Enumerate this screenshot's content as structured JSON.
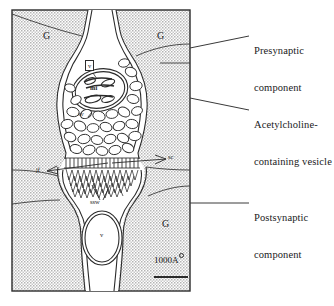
{
  "figure": {
    "frame": {
      "x": 12,
      "y": 10,
      "width": 178,
      "height": 281
    },
    "background_fill": "#d9d9d9",
    "line_color": "#1a1a1a"
  },
  "callouts": [
    {
      "id": "presynaptic",
      "line1": "Presynaptic",
      "line2": "component",
      "text_x": 254,
      "text_y": 27,
      "leader": {
        "x1": 190,
        "y1": 48,
        "x2": 249,
        "y2": 36
      }
    },
    {
      "id": "acetylcholine-vesicle",
      "line1": "Acetylcholine-",
      "line2": "containing vesicle",
      "text_x": 254,
      "text_y": 101,
      "leader": {
        "x1": 190,
        "y1": 98,
        "x2": 249,
        "y2": 110
      }
    },
    {
      "id": "postsynaptic",
      "line1": "Postsynaptic",
      "line2": "component",
      "text_x": 254,
      "text_y": 194,
      "leader": {
        "x1": 190,
        "y1": 203,
        "x2": 249,
        "y2": 203
      }
    }
  ],
  "region_labels": [
    {
      "id": "g-top-left",
      "text": "G",
      "x": 43,
      "y": 37
    },
    {
      "id": "g-top-right",
      "text": "G",
      "x": 157,
      "y": 37
    },
    {
      "id": "g-bottom-right",
      "text": "G",
      "x": 162,
      "y": 225
    }
  ],
  "structure_tags": [
    {
      "id": "vesicle-boxed",
      "text": "v",
      "x": 88,
      "y": 66,
      "boxed": true
    },
    {
      "id": "mitochondrion",
      "text": "mi",
      "x": 94,
      "y": 89,
      "boxed": false
    },
    {
      "id": "synaptic-vesicle",
      "text": "sv",
      "x": 82,
      "y": 115,
      "boxed": false
    },
    {
      "id": "synaptic-cleft",
      "text": "sc",
      "x": 168,
      "y": 158,
      "boxed": false
    },
    {
      "id": "junctional-folds",
      "text": "jf",
      "x": 38,
      "y": 171,
      "boxed": false
    },
    {
      "id": "subsynaptic-web",
      "text": "ssw",
      "x": 94,
      "y": 202,
      "boxed": false
    },
    {
      "id": "muscle-nucleus",
      "text": "v",
      "x": 103,
      "y": 235,
      "boxed": false
    }
  ],
  "scale_bar": {
    "label": "1000A",
    "unit_symbol": "angstrom-ring",
    "text_x": 155,
    "text_y": 261,
    "bar": {
      "x1": 154,
      "y1": 277,
      "x2": 188,
      "y2": 277
    }
  }
}
